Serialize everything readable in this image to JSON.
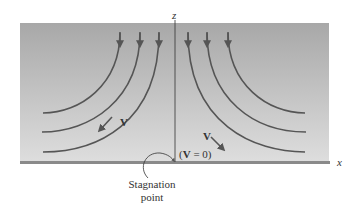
{
  "diagram": {
    "axes": {
      "vertical_label": "z",
      "horizontal_label": "x"
    },
    "labels": {
      "velocity_left": "V",
      "velocity_right": "V",
      "stagnation_condition_open": "(",
      "stagnation_condition_v": "V",
      "stagnation_condition_rest": " = 0)",
      "stagnation_point_line1": "Stagnation",
      "stagnation_point_line2": "point"
    },
    "colors": {
      "panel_top": "#a9a9a9",
      "panel_bottom": "#dcdcdc",
      "streamline": "#555555",
      "wall": "#8a8a8a",
      "axis": "#333333",
      "text": "#333333"
    },
    "streamlines": {
      "left_count": 3,
      "right_count": 3
    }
  }
}
